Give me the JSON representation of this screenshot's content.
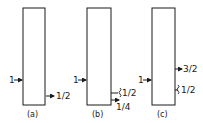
{
  "diagram": {
    "panels": [
      {
        "id": "a",
        "caption": "(a)",
        "input": {
          "label": "1"
        },
        "outputs": [
          {
            "label": "1/2",
            "type": "arrow"
          }
        ]
      },
      {
        "id": "b",
        "caption": "(b)",
        "input": {
          "label": "1"
        },
        "outputs": [
          {
            "label": "1/2",
            "type": "wavy"
          },
          {
            "label": "1/4",
            "type": "arrow"
          }
        ]
      },
      {
        "id": "c",
        "caption": "(c)",
        "input": {
          "label": "1"
        },
        "outputs": [
          {
            "label": "3/2",
            "type": "arrow"
          },
          {
            "label": "1/2",
            "type": "wavy"
          }
        ]
      }
    ]
  }
}
